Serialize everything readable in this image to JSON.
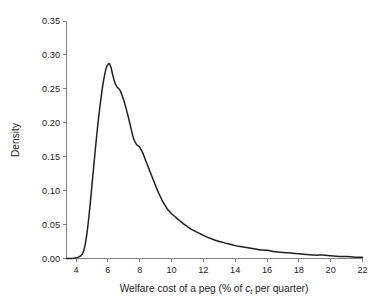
{
  "chart_data": {
    "type": "line",
    "title": "",
    "subtitle": "",
    "xlabel_full": "Welfare cost of a peg (% of c_t per quarter)",
    "xlabel_prefix": "Welfare cost of a peg (% of ",
    "xlabel_var": "c",
    "xlabel_sub": "t",
    "xlabel_suffix": " per quarter)",
    "ylabel": "Density",
    "xlim": [
      3.4,
      22.0
    ],
    "ylim": [
      0.0,
      0.35
    ],
    "grid": false,
    "legend": false,
    "legend_position": "none",
    "xticks": [
      4,
      6,
      8,
      10,
      12,
      14,
      16,
      18,
      20,
      22
    ],
    "xticklabels": [
      "4",
      "6",
      "8",
      "10",
      "12",
      "14",
      "16",
      "18",
      "20",
      "22"
    ],
    "yticks": [
      0.0,
      0.05,
      0.1,
      0.15,
      0.2,
      0.25,
      0.3,
      0.35
    ],
    "yticklabels": [
      "0.00",
      "0.05",
      "0.10",
      "0.15",
      "0.20",
      "0.25",
      "0.30",
      "0.35"
    ],
    "series": [
      {
        "name": "Density of welfare cost of a peg",
        "color": "#231f20",
        "x": [
          3.4,
          3.8,
          4.0,
          4.15,
          4.3,
          4.4,
          4.5,
          4.6,
          4.7,
          4.8,
          4.9,
          5.0,
          5.1,
          5.2,
          5.3,
          5.4,
          5.5,
          5.6,
          5.7,
          5.8,
          5.9,
          6.0,
          6.1,
          6.2,
          6.3,
          6.4,
          6.5,
          6.6,
          6.7,
          6.8,
          6.9,
          7.0,
          7.1,
          7.2,
          7.3,
          7.4,
          7.5,
          7.6,
          7.7,
          7.8,
          7.9,
          8.0,
          8.2,
          8.4,
          8.6,
          8.8,
          9.0,
          9.2,
          9.4,
          9.6,
          9.8,
          10.0,
          10.25,
          10.5,
          10.75,
          11.0,
          11.25,
          11.5,
          11.75,
          12.0,
          12.5,
          13.0,
          13.5,
          14.0,
          14.5,
          15.0,
          15.5,
          16.0,
          16.5,
          17.0,
          17.5,
          18.0,
          18.5,
          19.0,
          19.5,
          20.0,
          20.5,
          21.0,
          21.5,
          22.0
        ],
        "y": [
          0.0,
          0.0,
          0.001,
          0.002,
          0.004,
          0.007,
          0.013,
          0.024,
          0.04,
          0.06,
          0.083,
          0.108,
          0.133,
          0.158,
          0.182,
          0.204,
          0.224,
          0.242,
          0.258,
          0.271,
          0.281,
          0.286,
          0.287,
          0.281,
          0.271,
          0.262,
          0.256,
          0.252,
          0.25,
          0.246,
          0.24,
          0.233,
          0.225,
          0.216,
          0.207,
          0.197,
          0.187,
          0.178,
          0.172,
          0.168,
          0.166,
          0.164,
          0.155,
          0.143,
          0.131,
          0.119,
          0.107,
          0.096,
          0.086,
          0.078,
          0.071,
          0.066,
          0.061,
          0.056,
          0.051,
          0.047,
          0.043,
          0.04,
          0.037,
          0.034,
          0.029,
          0.025,
          0.022,
          0.019,
          0.017,
          0.015,
          0.013,
          0.012,
          0.01,
          0.009,
          0.008,
          0.007,
          0.006,
          0.005,
          0.005,
          0.004,
          0.003,
          0.003,
          0.002,
          0.002
        ]
      }
    ],
    "annotations": [],
    "peak": {
      "x": 6.1,
      "y": 0.287
    },
    "shoulder": {
      "x": 6.7,
      "y": 0.25
    }
  },
  "colors": {
    "curve": "#231f20",
    "axis": "#808285",
    "text": "#231f20",
    "background": "#ffffff"
  }
}
